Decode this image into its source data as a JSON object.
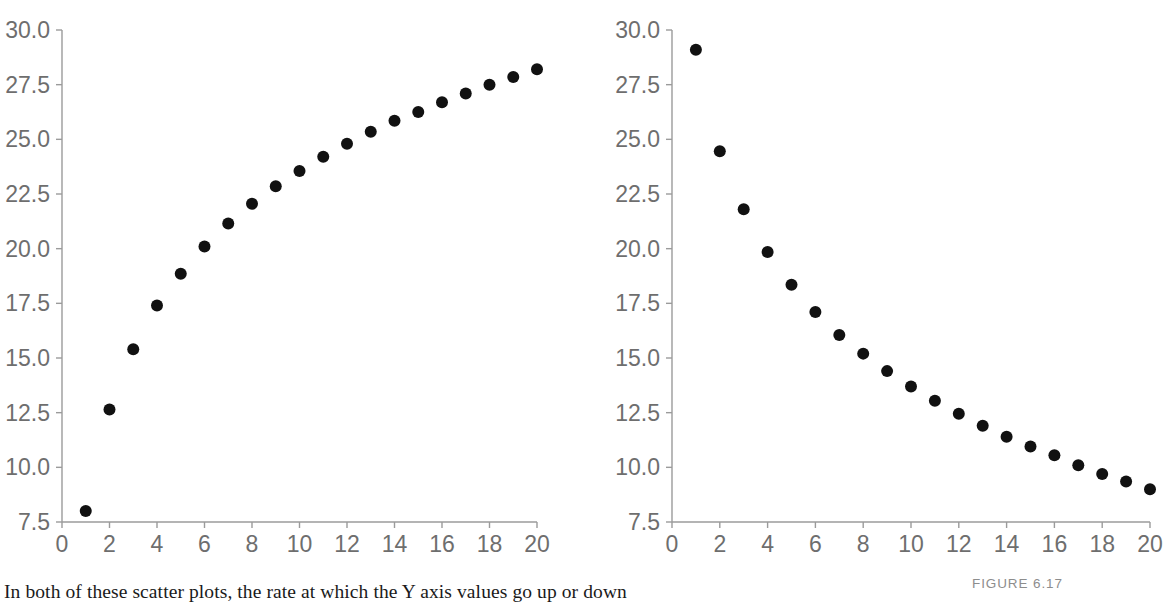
{
  "figure": {
    "label": "FIGURE 6.17",
    "caption": "In both of these scatter plots, the rate at which the Y axis values go up or down"
  },
  "style": {
    "axis_color": "#9b9b9b",
    "tick_label_color": "#6e6e6e",
    "marker_color": "#111111",
    "background": "#ffffff",
    "figure_label_color": "#8d8d8d"
  },
  "chart_data": [
    {
      "type": "scatter",
      "name": "left-scatter-increasing",
      "title": "",
      "xlabel": "",
      "ylabel": "",
      "xlim": [
        0,
        20
      ],
      "ylim": [
        7.5,
        30.0
      ],
      "xticks": [
        0,
        2,
        4,
        6,
        8,
        10,
        12,
        14,
        16,
        18,
        20
      ],
      "xtick_labels": [
        "0",
        "2",
        "4",
        "6",
        "8",
        "10",
        "12",
        "14",
        "16",
        "18",
        "20"
      ],
      "yticks": [
        7.5,
        10.0,
        12.5,
        15.0,
        17.5,
        20.0,
        22.5,
        25.0,
        27.5,
        30.0
      ],
      "ytick_labels": [
        "7.5",
        "10.0",
        "12.5",
        "15.0",
        "17.5",
        "20.0",
        "22.5",
        "25.0",
        "27.5",
        "30.0"
      ],
      "grid": false,
      "legend": false,
      "x": [
        1,
        2,
        3,
        4,
        5,
        6,
        7,
        8,
        9,
        10,
        11,
        12,
        13,
        14,
        15,
        16,
        17,
        18,
        19,
        20
      ],
      "y": [
        8.0,
        12.65,
        15.4,
        17.4,
        18.85,
        20.1,
        21.15,
        22.05,
        22.85,
        23.55,
        24.2,
        24.8,
        25.35,
        25.85,
        26.25,
        26.7,
        27.1,
        27.5,
        27.85,
        28.2
      ]
    },
    {
      "type": "scatter",
      "name": "right-scatter-decreasing",
      "title": "",
      "xlabel": "",
      "ylabel": "",
      "xlim": [
        0,
        20
      ],
      "ylim": [
        7.5,
        30.0
      ],
      "xticks": [
        0,
        2,
        4,
        6,
        8,
        10,
        12,
        14,
        16,
        18,
        20
      ],
      "xtick_labels": [
        "0",
        "2",
        "4",
        "6",
        "8",
        "10",
        "12",
        "14",
        "16",
        "18",
        "20"
      ],
      "yticks": [
        7.5,
        10.0,
        12.5,
        15.0,
        17.5,
        20.0,
        22.5,
        25.0,
        27.5,
        30.0
      ],
      "ytick_labels": [
        "7.5",
        "10.0",
        "12.5",
        "15.0",
        "17.5",
        "20.0",
        "22.5",
        "25.0",
        "27.5",
        "30.0"
      ],
      "grid": false,
      "legend": false,
      "x": [
        1,
        2,
        3,
        4,
        5,
        6,
        7,
        8,
        9,
        10,
        11,
        12,
        13,
        14,
        15,
        16,
        17,
        18,
        19,
        20
      ],
      "y": [
        29.1,
        24.45,
        21.8,
        19.85,
        18.35,
        17.1,
        16.05,
        15.2,
        14.4,
        13.7,
        13.05,
        12.45,
        11.9,
        11.4,
        10.95,
        10.55,
        10.1,
        9.7,
        9.35,
        9.0
      ]
    }
  ]
}
